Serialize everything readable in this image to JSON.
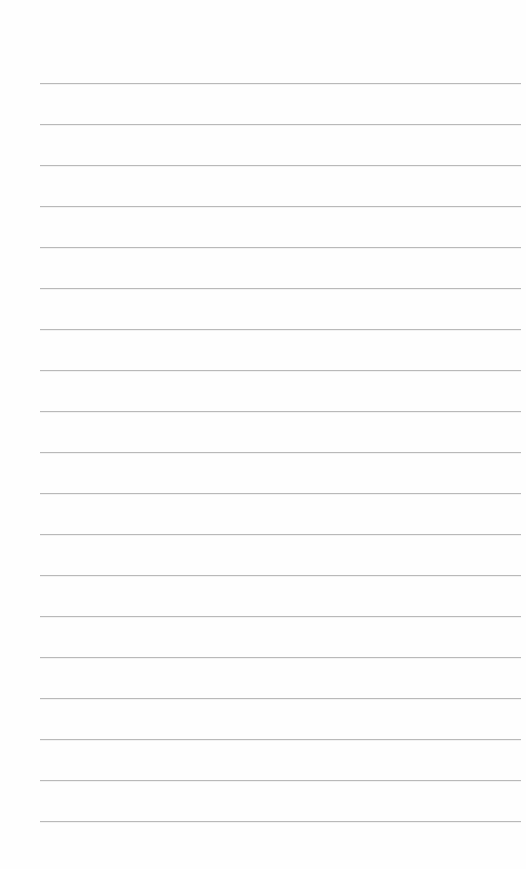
{
  "page": {
    "type": "blank-ruled-paper",
    "background_color": "#fefefe",
    "rule_color": "#b9b9b9",
    "rule_count": 19,
    "rules": [
      {
        "y": 83
      },
      {
        "y": 124
      },
      {
        "y": 165
      },
      {
        "y": 206
      },
      {
        "y": 247
      },
      {
        "y": 288
      },
      {
        "y": 329
      },
      {
        "y": 370
      },
      {
        "y": 411
      },
      {
        "y": 452
      },
      {
        "y": 493
      },
      {
        "y": 534
      },
      {
        "y": 575
      },
      {
        "y": 616
      },
      {
        "y": 657
      },
      {
        "y": 698
      },
      {
        "y": 739
      },
      {
        "y": 780
      },
      {
        "y": 821
      }
    ]
  }
}
